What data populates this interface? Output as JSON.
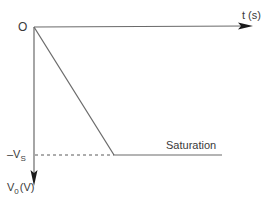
{
  "diagram": {
    "origin_label": "O",
    "x_axis_label": "t (s)",
    "y_axis_label_main": "V",
    "y_axis_label_sub": "0",
    "y_axis_label_unit": "(V)",
    "saturation_level_prefix": "–V",
    "saturation_level_sub": "S",
    "saturation_label": "Saturation",
    "colors": {
      "line": "#6a6a6a",
      "arrow": "#1a1a1a",
      "text": "#3a3a3a"
    }
  }
}
